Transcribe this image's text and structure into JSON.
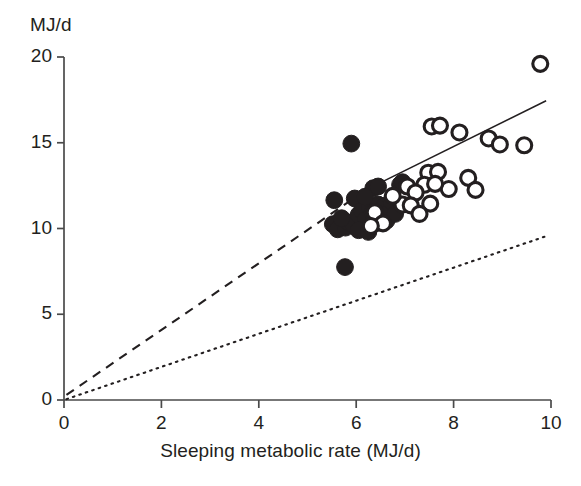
{
  "chart_data": {
    "type": "scatter",
    "title": "",
    "xlabel": "Sleeping metabolic rate (MJ/d)",
    "ylabel": "MJ/d",
    "xlim": [
      0,
      10
    ],
    "ylim": [
      0,
      20
    ],
    "xticks": [
      0,
      2,
      4,
      6,
      8,
      10
    ],
    "yticks": [
      0,
      5,
      10,
      15,
      20
    ],
    "xtick_labels": [
      "0",
      "2",
      "4",
      "6",
      "8",
      "10"
    ],
    "ytick_labels": [
      "0",
      "5",
      "10",
      "15",
      "20"
    ],
    "grid": false,
    "legend": null,
    "series": [
      {
        "name": "filled-circles",
        "marker": "filled-circle",
        "color": "#231f20",
        "points": [
          [
            5.77,
            7.75
          ],
          [
            5.9,
            14.95
          ],
          [
            5.55,
            11.65
          ],
          [
            5.97,
            11.75
          ],
          [
            5.52,
            10.25
          ],
          [
            5.62,
            9.95
          ],
          [
            5.78,
            10.05
          ],
          [
            5.85,
            10.35
          ],
          [
            5.95,
            10.2
          ],
          [
            6.05,
            10.8
          ],
          [
            6.12,
            11.05
          ],
          [
            6.2,
            10.55
          ],
          [
            6.28,
            11.2
          ],
          [
            6.33,
            10.95
          ],
          [
            6.4,
            10.3
          ],
          [
            6.45,
            11.4
          ],
          [
            6.5,
            10.7
          ],
          [
            6.58,
            11.3
          ],
          [
            6.62,
            10.45
          ],
          [
            6.7,
            11.05
          ],
          [
            6.35,
            12.35
          ],
          [
            6.45,
            12.45
          ],
          [
            6.9,
            12.55
          ],
          [
            6.95,
            12.7
          ],
          [
            6.18,
            11.85
          ],
          [
            6.72,
            11.6
          ],
          [
            6.8,
            10.85
          ],
          [
            6.05,
            9.9
          ],
          [
            6.25,
            9.8
          ],
          [
            5.7,
            10.6
          ]
        ]
      },
      {
        "name": "open-circles",
        "marker": "open-circle",
        "color": "#231f20",
        "points": [
          [
            9.78,
            19.6
          ],
          [
            7.55,
            15.95
          ],
          [
            7.72,
            16.0
          ],
          [
            8.12,
            15.6
          ],
          [
            8.72,
            15.25
          ],
          [
            8.95,
            14.9
          ],
          [
            9.45,
            14.85
          ],
          [
            7.48,
            13.25
          ],
          [
            7.68,
            13.3
          ],
          [
            8.3,
            12.95
          ],
          [
            8.45,
            12.25
          ],
          [
            7.9,
            12.3
          ],
          [
            7.4,
            12.55
          ],
          [
            7.62,
            12.6
          ],
          [
            7.05,
            12.45
          ],
          [
            7.22,
            12.1
          ],
          [
            7.52,
            11.45
          ],
          [
            6.95,
            11.4
          ],
          [
            7.12,
            11.35
          ],
          [
            7.3,
            10.85
          ],
          [
            6.38,
            10.95
          ],
          [
            6.55,
            10.3
          ],
          [
            6.3,
            10.15
          ],
          [
            6.75,
            11.9
          ]
        ]
      }
    ],
    "lines": [
      {
        "name": "regression-line",
        "style": "solid",
        "color": "#231f20",
        "x": [
          5.95,
          9.9
        ],
        "y": [
          11.9,
          17.45
        ]
      },
      {
        "name": "dashed-reference-line",
        "style": "dashed",
        "color": "#231f20",
        "x": [
          0.05,
          6.05
        ],
        "y": [
          0.3,
          11.95
        ]
      },
      {
        "name": "dotted-reference-line",
        "style": "dotted",
        "color": "#231f20",
        "x": [
          0.05,
          9.95
        ],
        "y": [
          0.05,
          9.6
        ]
      }
    ]
  }
}
